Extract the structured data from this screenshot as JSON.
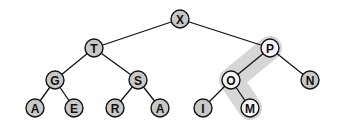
{
  "diagram": {
    "type": "binary-tree",
    "colors": {
      "node_fill": "#c8c8c8",
      "highlight_node_fill": "#f4f4f4",
      "highlight_path": "#d6d6d6",
      "stroke": "#111111"
    },
    "highlight_path_nodes": [
      "P",
      "O",
      "M"
    ],
    "nodes": [
      {
        "id": "n0",
        "label": "X",
        "x": 180,
        "y": 19,
        "highlight": false
      },
      {
        "id": "n1",
        "label": "T",
        "x": 94,
        "y": 48,
        "highlight": false
      },
      {
        "id": "n2",
        "label": "P",
        "x": 270,
        "y": 48,
        "highlight": true
      },
      {
        "id": "n3",
        "label": "G",
        "x": 55,
        "y": 80,
        "highlight": false
      },
      {
        "id": "n4",
        "label": "S",
        "x": 138,
        "y": 80,
        "highlight": false
      },
      {
        "id": "n5",
        "label": "O",
        "x": 231,
        "y": 80,
        "highlight": true
      },
      {
        "id": "n6",
        "label": "N",
        "x": 310,
        "y": 80,
        "highlight": false
      },
      {
        "id": "n7",
        "label": "A",
        "x": 35,
        "y": 108,
        "highlight": false
      },
      {
        "id": "n8",
        "label": "E",
        "x": 74,
        "y": 108,
        "highlight": false
      },
      {
        "id": "n9",
        "label": "R",
        "x": 115,
        "y": 108,
        "highlight": false
      },
      {
        "id": "n10",
        "label": "A",
        "x": 160,
        "y": 108,
        "highlight": false
      },
      {
        "id": "n11",
        "label": "I",
        "x": 203,
        "y": 108,
        "highlight": false
      },
      {
        "id": "n12",
        "label": "M",
        "x": 250,
        "y": 108,
        "highlight": true
      }
    ],
    "edges": [
      [
        "n0",
        "n1"
      ],
      [
        "n0",
        "n2"
      ],
      [
        "n1",
        "n3"
      ],
      [
        "n1",
        "n4"
      ],
      [
        "n2",
        "n5"
      ],
      [
        "n2",
        "n6"
      ],
      [
        "n3",
        "n7"
      ],
      [
        "n3",
        "n8"
      ],
      [
        "n4",
        "n9"
      ],
      [
        "n4",
        "n10"
      ],
      [
        "n5",
        "n11"
      ],
      [
        "n5",
        "n12"
      ]
    ]
  }
}
